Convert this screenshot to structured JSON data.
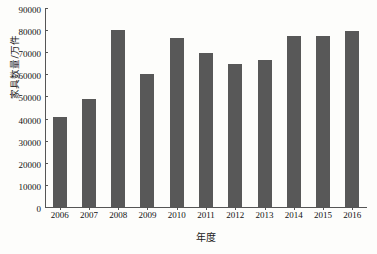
{
  "chart_data": {
    "type": "bar",
    "title": "",
    "xlabel": "年度",
    "ylabel": "家具数量/万件",
    "categories": [
      "2006",
      "2007",
      "2008",
      "2009",
      "2010",
      "2011",
      "2012",
      "2013",
      "2014",
      "2015",
      "2016"
    ],
    "values": [
      40800,
      49000,
      80200,
      60300,
      76500,
      69500,
      64800,
      66400,
      77500,
      77200,
      79500
    ],
    "ylim": [
      0,
      90000
    ],
    "yticks": [
      0,
      10000,
      20000,
      30000,
      40000,
      50000,
      60000,
      70000,
      80000,
      90000
    ],
    "ytick_labels": [
      "0",
      "10000",
      "20000",
      "30000",
      "40000",
      "50000",
      "60000",
      "70000",
      "80000",
      "90000"
    ],
    "grid": false,
    "legend": false,
    "series": [
      {
        "name": "家具数量",
        "values": [
          40800,
          49000,
          80200,
          60300,
          76500,
          69500,
          64800,
          66400,
          77500,
          77200,
          79500
        ]
      }
    ],
    "bar_color": "#585858",
    "background_color": "#fdfdfb",
    "axis_color": "#555555"
  }
}
